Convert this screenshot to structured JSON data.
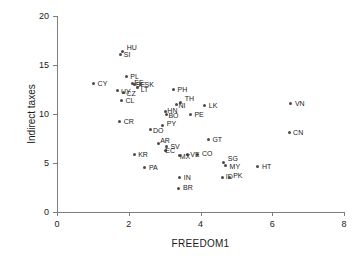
{
  "chart_data": {
    "type": "scatter",
    "title": "",
    "xlabel": "FREEDOM1",
    "ylabel": "Indirect taxes",
    "xlim": [
      0,
      8
    ],
    "ylim": [
      0,
      20
    ],
    "xticks": [
      0,
      2,
      4,
      6,
      8
    ],
    "yticks": [
      0,
      5,
      10,
      15,
      20
    ],
    "grid": false,
    "legend": "none",
    "marker_color": "#4a4a4a",
    "axis_color": "#7d7d7d",
    "points": [
      {
        "label": "HU",
        "x": 1.83,
        "y": 16.35,
        "lx": 4,
        "ly": -8
      },
      {
        "label": "SI",
        "x": 1.78,
        "y": 16.05,
        "lx": 3,
        "ly": -4
      },
      {
        "label": "PL",
        "x": 1.93,
        "y": 13.8,
        "lx": 4,
        "ly": -4
      },
      {
        "label": "CY",
        "x": 1.02,
        "y": 13.1,
        "lx": 4,
        "ly": -4
      },
      {
        "label": "EE",
        "x": 2.1,
        "y": 13.15,
        "lx": 2,
        "ly": -4
      },
      {
        "label": "SE",
        "x": 2.17,
        "y": 13.05,
        "lx": 1,
        "ly": -3
      },
      {
        "label": "SK",
        "x": 2.33,
        "y": 13.0,
        "lx": 4,
        "ly": -4
      },
      {
        "label": "LT",
        "x": 2.25,
        "y": 12.7,
        "lx": 3,
        "ly": -2
      },
      {
        "label": "UY",
        "x": 1.7,
        "y": 12.35,
        "lx": 3,
        "ly": -3
      },
      {
        "label": "CZ",
        "x": 1.85,
        "y": 12.2,
        "lx": 3,
        "ly": -2
      },
      {
        "label": "PH",
        "x": 3.25,
        "y": 12.45,
        "lx": 4,
        "ly": -4
      },
      {
        "label": "CL",
        "x": 1.8,
        "y": 11.35,
        "lx": 4,
        "ly": -4
      },
      {
        "label": "TH",
        "x": 3.45,
        "y": 11.2,
        "lx": 4,
        "ly": -7
      },
      {
        "label": "NI",
        "x": 3.33,
        "y": 10.95,
        "lx": 2,
        "ly": -3
      },
      {
        "label": "LK",
        "x": 4.12,
        "y": 10.85,
        "lx": 4,
        "ly": -4
      },
      {
        "label": "VN",
        "x": 6.52,
        "y": 11.05,
        "lx": 4,
        "ly": -4
      },
      {
        "label": "HN",
        "x": 3.02,
        "y": 10.25,
        "lx": 2,
        "ly": -5
      },
      {
        "label": "BO",
        "x": 3.05,
        "y": 10.0,
        "lx": 2,
        "ly": -2
      },
      {
        "label": "PE",
        "x": 3.72,
        "y": 9.9,
        "lx": 4,
        "ly": -4
      },
      {
        "label": "CR",
        "x": 1.75,
        "y": 9.2,
        "lx": 4,
        "ly": -4
      },
      {
        "label": "PY",
        "x": 2.95,
        "y": 8.85,
        "lx": 4,
        "ly": -5
      },
      {
        "label": "DO",
        "x": 2.62,
        "y": 8.4,
        "lx": 2,
        "ly": -3
      },
      {
        "label": "CN",
        "x": 6.47,
        "y": 8.1,
        "lx": 4,
        "ly": -4
      },
      {
        "label": "GT",
        "x": 4.22,
        "y": 7.35,
        "lx": 4,
        "ly": -4
      },
      {
        "label": "AR",
        "x": 2.82,
        "y": 7.0,
        "lx": 2,
        "ly": -6
      },
      {
        "label": "SV",
        "x": 3.05,
        "y": 6.65,
        "lx": 4,
        "ly": -4
      },
      {
        "label": "EC",
        "x": 3.02,
        "y": 6.25,
        "lx": 0,
        "ly": -4
      },
      {
        "label": "CO",
        "x": 3.93,
        "y": 5.9,
        "lx": 4,
        "ly": -4
      },
      {
        "label": "VE",
        "x": 3.63,
        "y": 5.85,
        "lx": 3,
        "ly": -4
      },
      {
        "label": "MX",
        "x": 3.42,
        "y": 5.75,
        "lx": 0,
        "ly": -3
      },
      {
        "label": "KR",
        "x": 2.15,
        "y": 5.85,
        "lx": 4,
        "ly": -4
      },
      {
        "label": "SG",
        "x": 4.65,
        "y": 5.1,
        "lx": 4,
        "ly": -7
      },
      {
        "label": "MY",
        "x": 4.7,
        "y": 4.7,
        "lx": 4,
        "ly": -3
      },
      {
        "label": "HT",
        "x": 5.6,
        "y": 4.6,
        "lx": 4,
        "ly": -4
      },
      {
        "label": "PA",
        "x": 2.45,
        "y": 4.5,
        "lx": 4,
        "ly": -4
      },
      {
        "label": "ID",
        "x": 4.62,
        "y": 3.55,
        "lx": 3,
        "ly": -4
      },
      {
        "label": "PK",
        "x": 4.8,
        "y": 3.55,
        "lx": 4,
        "ly": -5
      },
      {
        "label": "IN",
        "x": 3.42,
        "y": 3.5,
        "lx": 4,
        "ly": -4
      },
      {
        "label": "BR",
        "x": 3.4,
        "y": 2.4,
        "lx": 4,
        "ly": -4
      }
    ]
  }
}
